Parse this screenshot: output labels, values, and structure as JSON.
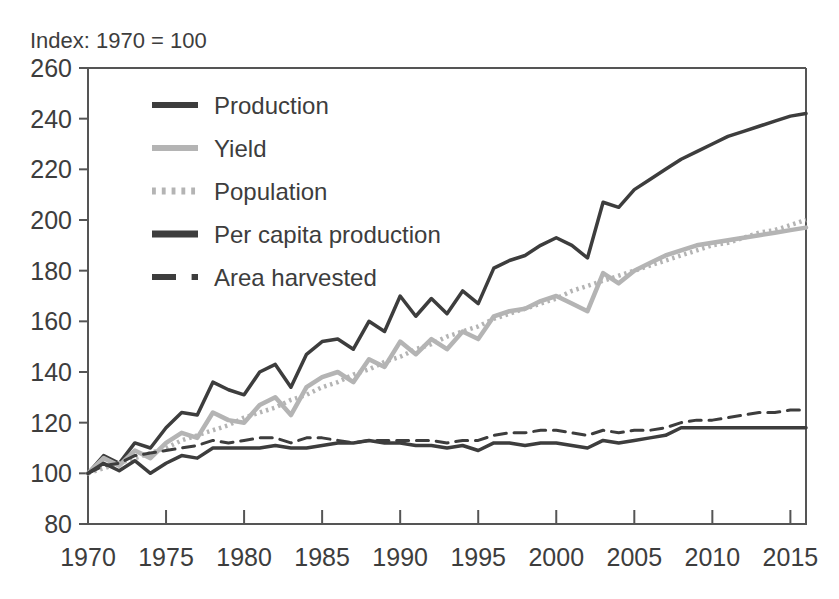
{
  "subtitle": "Index: 1970 = 100",
  "colors": {
    "dark": "#3d3d3d",
    "light": "#b4b4b4",
    "axis": "#555555",
    "background": "#ffffff"
  },
  "chart_data": {
    "type": "line",
    "title": "",
    "subtitle": "Index: 1970 = 100",
    "xlabel": "",
    "ylabel": "",
    "xlim": [
      1970,
      2016
    ],
    "ylim": [
      80,
      260
    ],
    "ytick_step": 20,
    "yticks": [
      80,
      100,
      120,
      140,
      160,
      180,
      200,
      220,
      240,
      260
    ],
    "xticks": [
      1970,
      1975,
      1980,
      1985,
      1990,
      1995,
      2000,
      2005,
      2010,
      2015
    ],
    "grid": false,
    "legend_position": "top-left",
    "x": [
      1970,
      1971,
      1972,
      1973,
      1974,
      1975,
      1976,
      1977,
      1978,
      1979,
      1980,
      1981,
      1982,
      1983,
      1984,
      1985,
      1986,
      1987,
      1988,
      1989,
      1990,
      1991,
      1992,
      1993,
      1994,
      1995,
      1996,
      1997,
      1998,
      1999,
      2000,
      2001,
      2002,
      2003,
      2004,
      2005,
      2006,
      2007,
      2008,
      2009,
      2010,
      2011,
      2012,
      2013,
      2014,
      2015,
      2016
    ],
    "series": [
      {
        "name": "Production",
        "style": "solid",
        "color": "#3d3d3d",
        "width": 3.5,
        "values": [
          100,
          107,
          104,
          112,
          110,
          118,
          124,
          123,
          136,
          133,
          131,
          140,
          143,
          134,
          147,
          152,
          153,
          149,
          160,
          156,
          170,
          162,
          169,
          163,
          172,
          167,
          181,
          184,
          186,
          190,
          193,
          190,
          185,
          207,
          205,
          212,
          216,
          220,
          224,
          227,
          230,
          233,
          235,
          237,
          239,
          241,
          242
        ]
      },
      {
        "name": "Yield",
        "style": "solid",
        "color": "#b4b4b4",
        "width": 4.5,
        "values": [
          100,
          106,
          103,
          109,
          106,
          112,
          116,
          114,
          124,
          121,
          120,
          127,
          130,
          123,
          134,
          138,
          140,
          136,
          145,
          142,
          152,
          147,
          153,
          149,
          156,
          153,
          162,
          164,
          165,
          168,
          170,
          167,
          164,
          179,
          175,
          180,
          183,
          186,
          188,
          190,
          191,
          192,
          193,
          194,
          195,
          196,
          197
        ]
      },
      {
        "name": "Population",
        "style": "dotted",
        "color": "#b4b4b4",
        "width": 4.5,
        "values": [
          100,
          102,
          104,
          106,
          108,
          110,
          113,
          115,
          117,
          119,
          122,
          124,
          126,
          129,
          131,
          134,
          136,
          139,
          141,
          144,
          146,
          149,
          151,
          154,
          156,
          158,
          161,
          163,
          165,
          167,
          169,
          172,
          174,
          176,
          178,
          180,
          182,
          184,
          186,
          188,
          190,
          191,
          193,
          195,
          196,
          198,
          200
        ]
      },
      {
        "name": "Per capita production",
        "style": "solid",
        "color": "#3d3d3d",
        "width": 3.5,
        "values": [
          100,
          104,
          101,
          105,
          100,
          104,
          107,
          106,
          110,
          110,
          110,
          110,
          111,
          110,
          110,
          111,
          112,
          112,
          113,
          112,
          112,
          111,
          111,
          110,
          111,
          109,
          112,
          112,
          111,
          112,
          112,
          111,
          110,
          113,
          112,
          113,
          114,
          115,
          118,
          118,
          118,
          118,
          118,
          118,
          118,
          118,
          118
        ]
      },
      {
        "name": "Area harvested",
        "style": "dashed",
        "color": "#3d3d3d",
        "width": 3,
        "values": [
          100,
          103,
          104,
          107,
          108,
          109,
          110,
          111,
          113,
          112,
          113,
          114,
          114,
          112,
          114,
          114,
          113,
          112,
          113,
          113,
          113,
          113,
          113,
          112,
          113,
          113,
          115,
          116,
          116,
          117,
          117,
          116,
          115,
          117,
          116,
          117,
          117,
          118,
          120,
          121,
          121,
          122,
          123,
          124,
          124,
          125,
          125
        ]
      }
    ]
  },
  "legend": {
    "items": [
      {
        "label": "Production",
        "swatch": "solid-dark"
      },
      {
        "label": "Yield",
        "swatch": "solid-light"
      },
      {
        "label": "Population",
        "swatch": "dotted-light"
      },
      {
        "label": "Per capita production",
        "swatch": "solid-dark-thick"
      },
      {
        "label": "Area harvested",
        "swatch": "dashed-dark"
      }
    ]
  }
}
